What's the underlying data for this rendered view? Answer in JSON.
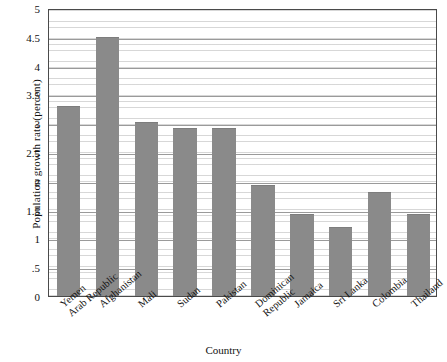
{
  "chart_data": {
    "type": "bar",
    "title": "",
    "xlabel": "Country",
    "ylabel": "Population growth rate (percent)",
    "ylim": [
      0,
      5
    ],
    "yticks": [
      "0",
      ".5",
      "1",
      "1.5",
      "2",
      "2.5",
      "3",
      "3.5",
      "4",
      "4.5",
      "5"
    ],
    "ytick_values": [
      0,
      0.5,
      1,
      1.5,
      2,
      2.5,
      3,
      3.5,
      4,
      4.5,
      5
    ],
    "grid": "horizontal-major-and-minor",
    "legend": "none",
    "bar_color": "#8a8a8a",
    "categories": [
      "Yemen Arab Republic",
      "Afghanistan",
      "Mali",
      "Sudan",
      "Pakistan",
      "Dominican Republic",
      "Jamaica",
      "Sri Lanka",
      "Colombia",
      "Thailand"
    ],
    "category_lines": [
      [
        "Yemen",
        "Arab Republic"
      ],
      [
        "Afghanistan",
        ""
      ],
      [
        "Mali",
        ""
      ],
      [
        "Sudan",
        ""
      ],
      [
        "Pakistan",
        ""
      ],
      [
        "Dominican",
        "Republic"
      ],
      [
        "Jamaica",
        ""
      ],
      [
        "Sri Lanka",
        ""
      ],
      [
        "Colombia",
        ""
      ],
      [
        "Thailand",
        ""
      ]
    ],
    "values": [
      3.3,
      4.5,
      3.02,
      2.92,
      2.92,
      1.92,
      1.42,
      1.2,
      1.8,
      1.42
    ]
  }
}
